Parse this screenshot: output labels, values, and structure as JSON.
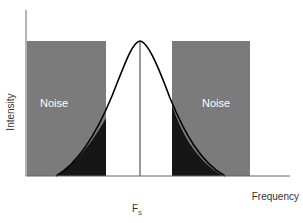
{
  "diagram": {
    "y_axis_label": "Intensity",
    "x_axis_label": "Frequency",
    "center_label_main": "F",
    "center_label_sub": "S",
    "noise_left_label": "Noise",
    "noise_right_label": "Noise",
    "colors": {
      "noise_band": "#7a7a7a",
      "overlap": "#161616",
      "curve": "#000000",
      "axis": "#555555",
      "noise_text": "#ffffff"
    }
  }
}
